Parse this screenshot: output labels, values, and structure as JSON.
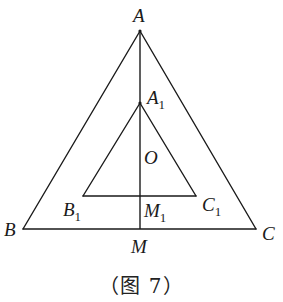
{
  "figure": {
    "caption": "（图 7）",
    "line_color": "#1a1a1a",
    "points": {
      "A": {
        "label": "A",
        "sub": "",
        "x": 140,
        "y": 31
      },
      "A1": {
        "label": "A",
        "sub": "1",
        "x": 140,
        "y": 103
      },
      "B": {
        "label": "B",
        "sub": "",
        "x": 23,
        "y": 229
      },
      "C": {
        "label": "C",
        "sub": "",
        "x": 256,
        "y": 229
      },
      "M": {
        "label": "M",
        "sub": "",
        "x": 140,
        "y": 229
      },
      "B1": {
        "label": "B",
        "sub": "1",
        "x": 83,
        "y": 196
      },
      "C1": {
        "label": "C",
        "sub": "1",
        "x": 196,
        "y": 196
      },
      "M1": {
        "label": "M",
        "sub": "1",
        "x": 140,
        "y": 196
      },
      "O": {
        "label": "O",
        "sub": "",
        "x": 140,
        "y": 157
      }
    },
    "segments": [
      {
        "from": "A",
        "to": "B"
      },
      {
        "from": "A",
        "to": "C"
      },
      {
        "from": "B",
        "to": "C"
      },
      {
        "from": "A1",
        "to": "B1"
      },
      {
        "from": "A1",
        "to": "C1"
      },
      {
        "from": "B1",
        "to": "C1"
      },
      {
        "from": "A",
        "to": "M"
      }
    ]
  }
}
